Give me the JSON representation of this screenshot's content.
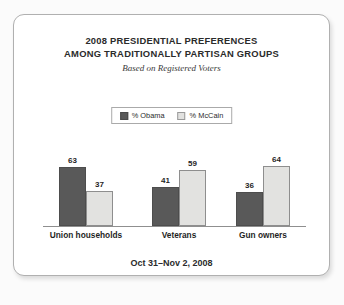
{
  "card": {
    "title_lines": [
      "2008 PRESIDENTIAL PREFERENCES",
      "AMONG TRADITIONALLY PARTISAN GROUPS"
    ],
    "subtitle": "Based on Registered Voters",
    "footer": "Oct 31–Nov 2, 2008"
  },
  "legend": {
    "items": [
      {
        "label": "% Obama",
        "color": "#595959"
      },
      {
        "label": "% McCain",
        "color": "#e2e2e0"
      }
    ]
  },
  "chart_data": {
    "type": "bar",
    "title": "2008 PRESIDENTIAL PREFERENCES AMONG TRADITIONALLY PARTISAN GROUPS",
    "subtitle": "Based on Registered Voters",
    "annotation": "Oct 31–Nov 2, 2008",
    "categories": [
      "Union households",
      "Veterans",
      "Gun owners"
    ],
    "series": [
      {
        "name": "% Obama",
        "color": "#595959",
        "values": [
          63,
          41,
          36
        ]
      },
      {
        "name": "% McCain",
        "color": "#e2e2e0",
        "values": [
          37,
          59,
          64
        ]
      }
    ],
    "xlabel": "",
    "ylabel": "",
    "ylim": [
      0,
      70
    ],
    "grid": false,
    "legend_position": "top-center",
    "data_labels": true
  }
}
